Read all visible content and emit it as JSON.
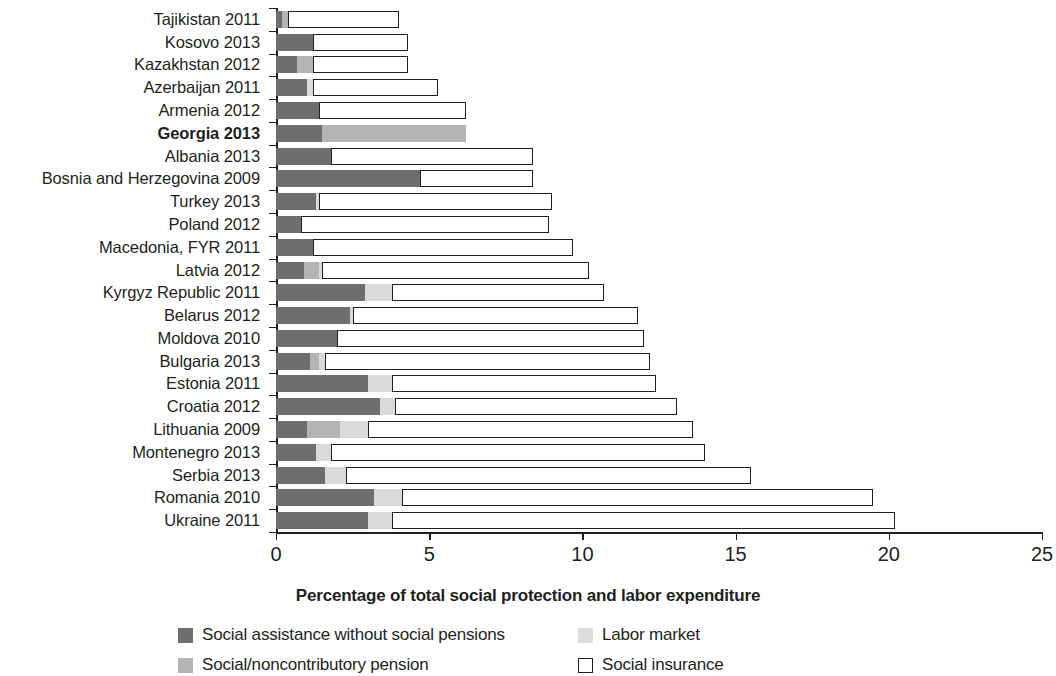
{
  "chart_data": {
    "type": "bar",
    "orientation": "horizontal",
    "stacked": true,
    "title": "",
    "xlabel": "Percentage of total social protection and labor expenditure",
    "ylabel": "",
    "xlim": [
      0,
      25
    ],
    "xticks": [
      0,
      5,
      10,
      15,
      20,
      25
    ],
    "xtick_labels": [
      "0",
      "5",
      "10",
      "15",
      "20",
      "25"
    ],
    "grid": false,
    "legend_position": "bottom",
    "highlight_category": "Georgia 2013",
    "categories": [
      "Tajikistan 2011",
      "Kosovo 2013",
      "Kazakhstan 2012",
      "Azerbaijan 2011",
      "Armenia 2012",
      "Georgia 2013",
      "Albania 2013",
      "Bosnia and Herzegovina 2009",
      "Turkey 2013",
      "Poland 2012",
      "Macedonia, FYR 2011",
      "Latvia 2012",
      "Kyrgyz Republic 2011",
      "Belarus 2012",
      "Moldova 2010",
      "Bulgaria 2013",
      "Estonia 2011",
      "Croatia 2012",
      "Lithuania 2009",
      "Montenegro 2013",
      "Serbia 2013",
      "Romania 2010",
      "Ukraine 2011"
    ],
    "series": [
      {
        "name": "Social assistance without social pensions",
        "key": "sa",
        "color": "#6d6e70",
        "values": [
          0.2,
          1.2,
          0.7,
          1.0,
          1.4,
          1.5,
          1.8,
          4.7,
          1.3,
          0.8,
          1.2,
          0.9,
          2.9,
          2.4,
          2.0,
          1.1,
          3.0,
          3.4,
          1.0,
          1.3,
          1.6,
          3.2,
          3.0
        ]
      },
      {
        "name": "Social/noncontributory pension",
        "key": "sp",
        "color": "#b3b3b3",
        "values": [
          0.2,
          0.0,
          0.5,
          0.0,
          0.0,
          4.7,
          0.0,
          0.0,
          0.0,
          0.0,
          0.0,
          0.5,
          0.0,
          0.0,
          0.0,
          0.3,
          0.0,
          0.0,
          1.1,
          0.0,
          0.0,
          0.0,
          0.0
        ]
      },
      {
        "name": "Labor market",
        "key": "lm",
        "color": "#dcdcdc",
        "values": [
          0.0,
          0.0,
          0.0,
          0.2,
          0.0,
          0.0,
          0.0,
          0.0,
          0.1,
          0.0,
          0.0,
          0.1,
          0.9,
          0.1,
          0.0,
          0.2,
          0.8,
          0.5,
          0.9,
          0.5,
          0.7,
          0.9,
          0.8
        ]
      },
      {
        "name": "Social insurance",
        "key": "si",
        "color": "#ffffff",
        "values": [
          3.6,
          3.1,
          3.1,
          4.1,
          4.8,
          0.0,
          6.6,
          3.7,
          7.6,
          8.1,
          8.5,
          8.7,
          6.9,
          9.3,
          10.0,
          10.6,
          8.6,
          9.2,
          10.6,
          12.2,
          13.2,
          15.4,
          16.4
        ]
      }
    ],
    "totals": [
      4.0,
      4.3,
      4.3,
      5.3,
      6.2,
      6.2,
      8.4,
      8.4,
      9.0,
      8.9,
      9.7,
      10.2,
      10.7,
      11.8,
      12.0,
      12.2,
      12.4,
      13.1,
      13.6,
      14.0,
      15.5,
      19.5,
      20.2
    ]
  },
  "legend": {
    "items": [
      {
        "label": "Social assistance without social pensions",
        "swatch": "sa"
      },
      {
        "label": "Labor market",
        "swatch": "lm"
      },
      {
        "label": "Social/noncontributory pension",
        "swatch": "sp"
      },
      {
        "label": "Social insurance",
        "swatch": "si"
      }
    ]
  }
}
